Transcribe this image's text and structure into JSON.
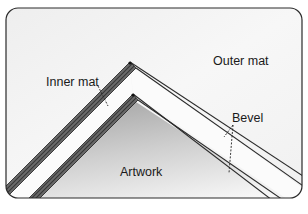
{
  "diagram": {
    "labels": {
      "inner_mat": "Inner mat",
      "outer_mat": "Outer mat",
      "bevel": "Bevel",
      "artwork": "Artwork"
    },
    "colors": {
      "frame_stroke": "#2a2a2a",
      "mat_fill": "#f4f4f4",
      "bevel_hatch": "#3a3a3a",
      "artwork_shade_dark": "#b4b4b4",
      "artwork_shade_light": "#f6f6f6",
      "line": "#2a2a2a"
    }
  }
}
